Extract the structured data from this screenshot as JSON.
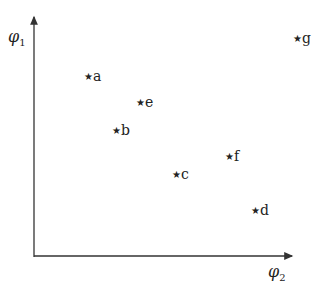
{
  "chart_data": {
    "type": "scatter",
    "title": "",
    "xlabel": "φ2",
    "ylabel": "φ1",
    "marker": "star",
    "grid": false,
    "points": [
      {
        "label": "a",
        "px": 88,
        "py": 77
      },
      {
        "label": "e",
        "px": 140,
        "py": 103
      },
      {
        "label": "b",
        "px": 116,
        "py": 131
      },
      {
        "label": "c",
        "px": 176,
        "py": 175
      },
      {
        "label": "f",
        "px": 229,
        "py": 157
      },
      {
        "label": "d",
        "px": 255,
        "py": 211
      },
      {
        "label": "g",
        "px": 297,
        "py": 39
      }
    ]
  },
  "axes": {
    "x_symbol": "φ",
    "x_sub": "2",
    "y_symbol": "φ",
    "y_sub": "1",
    "color": "#333333"
  },
  "marker_glyph": "★"
}
